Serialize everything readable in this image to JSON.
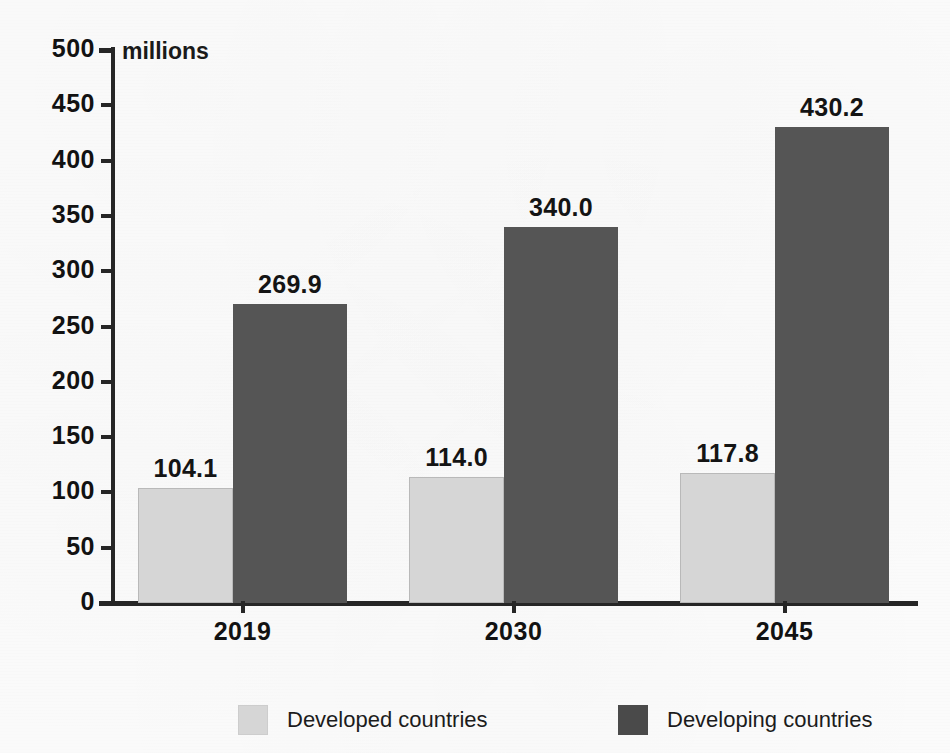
{
  "chart_data": {
    "type": "bar",
    "title": "",
    "subtitle": "",
    "unit_label": "millions",
    "xlabel": "",
    "ylabel": "",
    "ylim": [
      0,
      500
    ],
    "ytick_step": 50,
    "yticks": [
      "500",
      "450",
      "400",
      "350",
      "300",
      "250",
      "200",
      "150",
      "100",
      "50",
      "0"
    ],
    "ytick_values": [
      500,
      450,
      400,
      350,
      300,
      250,
      200,
      150,
      100,
      50,
      0
    ],
    "grid": false,
    "legend_position": "bottom",
    "categories": [
      "2019",
      "2030",
      "2045"
    ],
    "series": [
      {
        "name": "Developed countries",
        "color": "#d6d6d6",
        "values": [
          104.1,
          114.0,
          117.8
        ],
        "labels": [
          "104.1",
          "114.0",
          "117.8"
        ]
      },
      {
        "name": "Developing countries",
        "color": "#555555",
        "values": [
          269.9,
          340.0,
          430.2
        ],
        "labels": [
          "269.9",
          "340.0",
          "430.2"
        ]
      }
    ]
  },
  "legend": {
    "items": [
      {
        "label": "Developed countries",
        "swatch": "developed"
      },
      {
        "label": "Developing countries",
        "swatch": "developing"
      }
    ]
  },
  "colors": {
    "developed": "#d6d6d6",
    "developing": "#555555",
    "axis": "#262626",
    "text": "#121212",
    "background": "#fcfcfc"
  }
}
